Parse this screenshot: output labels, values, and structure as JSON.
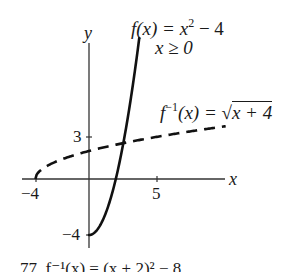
{
  "figure": {
    "axis_labels": {
      "x": "x",
      "y": "y"
    },
    "ticks": {
      "x_neg": "−4",
      "x_pos": "5",
      "y_pos": "3",
      "y_neg": "−4"
    },
    "f_label": {
      "name": "f",
      "arg": "(x) = x",
      "exp": "2",
      "rest": " − 4",
      "domain": "x ≥ 0"
    },
    "finv_label": {
      "name": "f",
      "exp": "−1",
      "arg": "(x) = ",
      "radical": "√",
      "radicand": "x + 4"
    },
    "caption_partial": "77.   f⁻¹(x) = (x + 2)² − 8 ..."
  },
  "chart_data": {
    "type": "line",
    "title": "",
    "xlabel": "x",
    "ylabel": "y",
    "xlim": [
      -5,
      10.5
    ],
    "ylim": [
      -5,
      10.5
    ],
    "tick_labels": {
      "x": [
        "-4",
        "5"
      ],
      "y": [
        "3",
        "-4"
      ]
    },
    "grid": false,
    "series": [
      {
        "name": "f(x) = x^2 - 4, x >= 0",
        "style": "solid",
        "x": [
          0,
          0.5,
          1,
          1.5,
          2,
          2.5,
          3,
          3.5,
          3.75
        ],
        "y": [
          -4,
          -3.75,
          -3,
          -1.75,
          0,
          2.25,
          5,
          8.25,
          10.06
        ]
      },
      {
        "name": "f^-1(x) = sqrt(x + 4)",
        "style": "dashed",
        "x": [
          -4,
          -3,
          -2,
          0,
          2,
          4,
          6,
          8,
          10.2
        ],
        "y": [
          0,
          1,
          1.41,
          2,
          2.45,
          2.83,
          3.16,
          3.46,
          3.77
        ]
      }
    ],
    "annotations": [
      "f(x) = x² − 4",
      "x ≥ 0",
      "f⁻¹(x) = √(x + 4)"
    ]
  }
}
